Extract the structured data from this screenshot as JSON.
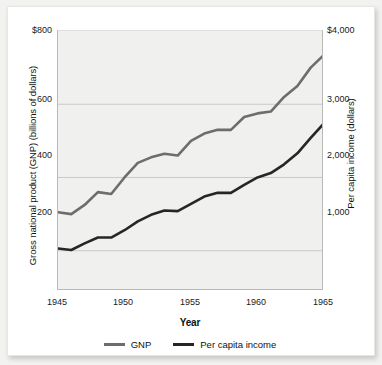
{
  "chart_data": {
    "type": "line",
    "title": "",
    "xlabel": "Year",
    "ylabel": "Gross national product (GNP) (billions of dollars)",
    "ylabel_right": "Per capita income (dollars)",
    "x": [
      1945,
      1946,
      1947,
      1948,
      1949,
      1950,
      1951,
      1952,
      1953,
      1954,
      1955,
      1956,
      1957,
      1958,
      1959,
      1960,
      1961,
      1962,
      1963,
      1964,
      1965
    ],
    "xlim": [
      1945,
      1965
    ],
    "xticks": [
      1945,
      1950,
      1955,
      1960,
      1965
    ],
    "xtick_labels": [
      "1945",
      "1950",
      "1955",
      "1960",
      "1965"
    ],
    "ylim": [
      90,
      800
    ],
    "yticks": [
      200,
      400,
      600,
      800
    ],
    "ytick_labels": [
      "200",
      "400",
      "600",
      "$800"
    ],
    "ylim_right": [
      450,
      4000
    ],
    "yticks_right": [
      1000,
      2000,
      3000,
      4000
    ],
    "ytick_labels_right": [
      "1,000",
      "2,000",
      "3,000",
      "$4,000"
    ],
    "grid": true,
    "legend_position": "bottom",
    "series": [
      {
        "name": "GNP",
        "axis": "left",
        "color": "#6d6d6b",
        "values": [
          305,
          300,
          325,
          360,
          355,
          400,
          440,
          455,
          465,
          460,
          500,
          520,
          530,
          530,
          565,
          575,
          580,
          620,
          650,
          700,
          735
        ]
      },
      {
        "name": "Per capita income",
        "axis": "right",
        "color": "#262626",
        "values": [
          1030,
          1010,
          1100,
          1180,
          1180,
          1280,
          1400,
          1490,
          1550,
          1540,
          1640,
          1740,
          1790,
          1790,
          1900,
          2000,
          2060,
          2180,
          2330,
          2540,
          2740
        ]
      }
    ]
  },
  "legend": {
    "items": [
      {
        "label": "GNP",
        "color": "#6d6d6b"
      },
      {
        "label": "Per capita income",
        "color": "#262626"
      }
    ]
  }
}
